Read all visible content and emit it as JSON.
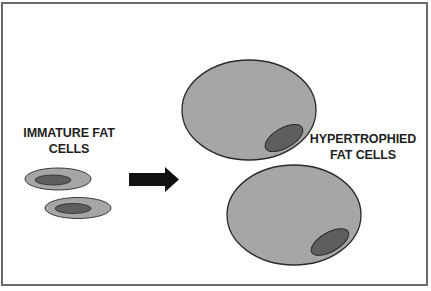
{
  "diagram": {
    "labels": {
      "immature": {
        "line1": "IMMATURE FAT",
        "line2": "CELLS"
      },
      "hypertrophied": {
        "line1": "HYPERTROPHIED",
        "line2": "FAT CELLS"
      }
    },
    "colors": {
      "cell_fill": "#a6a6a6",
      "cell_stroke": "#2a2a2a",
      "nucleus_fill": "#5e5e5e",
      "arrow": "#111111",
      "border": "#6a6a6a"
    },
    "elements": [
      {
        "id": "immature-cell-1",
        "type": "small-fat-cell"
      },
      {
        "id": "immature-cell-2",
        "type": "small-fat-cell"
      },
      {
        "id": "growth-arrow",
        "type": "arrow",
        "direction": "right"
      },
      {
        "id": "hypertrophied-cell-1",
        "type": "large-fat-cell"
      },
      {
        "id": "hypertrophied-cell-2",
        "type": "large-fat-cell"
      }
    ]
  }
}
